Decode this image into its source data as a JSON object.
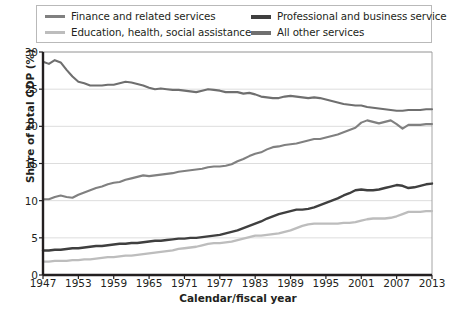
{
  "chart_data": {
    "type": "line",
    "title": "",
    "xlabel": "Calendar/fiscal year",
    "ylabel": "Share of total GDP (%)",
    "xlim": [
      1947,
      2013
    ],
    "ylim": [
      0,
      30
    ],
    "yticks": [
      0,
      5,
      10,
      15,
      20,
      25,
      30
    ],
    "xticks": [
      1947,
      1953,
      1959,
      1965,
      1971,
      1977,
      1983,
      1989,
      1995,
      2001,
      2007,
      2013
    ],
    "grid": "horizontal",
    "legend_position": "top",
    "x": [
      1947,
      1948,
      1949,
      1950,
      1951,
      1952,
      1953,
      1954,
      1955,
      1956,
      1957,
      1958,
      1959,
      1960,
      1961,
      1962,
      1963,
      1964,
      1965,
      1966,
      1967,
      1968,
      1969,
      1970,
      1971,
      1972,
      1973,
      1974,
      1975,
      1976,
      1977,
      1978,
      1979,
      1980,
      1981,
      1982,
      1983,
      1984,
      1985,
      1986,
      1987,
      1988,
      1989,
      1990,
      1991,
      1992,
      1993,
      1994,
      1995,
      1996,
      1997,
      1998,
      1999,
      2000,
      2001,
      2002,
      2003,
      2004,
      2005,
      2006,
      2007,
      2008,
      2009,
      2010,
      2011,
      2012,
      2013
    ],
    "series": [
      {
        "name": "All other services",
        "color": "#6f6f6f",
        "width": 2.1,
        "values": [
          28.7,
          28.4,
          28.9,
          28.6,
          27.6,
          26.7,
          26.0,
          25.8,
          25.5,
          25.5,
          25.5,
          25.6,
          25.6,
          25.8,
          26.0,
          25.9,
          25.7,
          25.5,
          25.2,
          25.0,
          25.1,
          25.0,
          24.9,
          24.9,
          24.8,
          24.7,
          24.6,
          24.8,
          25.0,
          24.9,
          24.8,
          24.6,
          24.6,
          24.6,
          24.4,
          24.5,
          24.3,
          24.0,
          23.9,
          23.8,
          23.8,
          24.0,
          24.1,
          24.0,
          23.9,
          23.8,
          23.9,
          23.8,
          23.6,
          23.4,
          23.2,
          23.0,
          22.9,
          22.8,
          22.8,
          22.6,
          22.5,
          22.4,
          22.3,
          22.2,
          22.1,
          22.1,
          22.2,
          22.2,
          22.2,
          22.3,
          22.3
        ]
      },
      {
        "name": "Finance and related services",
        "color": "#808080",
        "width": 2.1,
        "values": [
          10.2,
          10.2,
          10.5,
          10.7,
          10.5,
          10.4,
          10.8,
          11.1,
          11.4,
          11.7,
          11.9,
          12.2,
          12.4,
          12.5,
          12.8,
          13.0,
          13.2,
          13.4,
          13.3,
          13.4,
          13.5,
          13.6,
          13.7,
          13.9,
          14.0,
          14.1,
          14.2,
          14.3,
          14.5,
          14.6,
          14.6,
          14.7,
          14.9,
          15.3,
          15.6,
          16.0,
          16.3,
          16.5,
          16.9,
          17.2,
          17.3,
          17.5,
          17.6,
          17.7,
          17.9,
          18.1,
          18.3,
          18.3,
          18.5,
          18.7,
          18.9,
          19.2,
          19.5,
          19.8,
          20.5,
          20.8,
          20.6,
          20.4,
          20.6,
          20.8,
          20.3,
          19.7,
          20.2,
          20.2,
          20.2,
          20.3,
          20.3
        ]
      },
      {
        "name": "Professional and business service",
        "color": "#3f3f3f",
        "width": 2.4,
        "values": [
          3.3,
          3.3,
          3.4,
          3.4,
          3.5,
          3.6,
          3.6,
          3.7,
          3.8,
          3.9,
          3.9,
          4.0,
          4.1,
          4.2,
          4.2,
          4.3,
          4.3,
          4.4,
          4.5,
          4.6,
          4.6,
          4.7,
          4.8,
          4.9,
          4.9,
          5.0,
          5.0,
          5.1,
          5.2,
          5.3,
          5.4,
          5.6,
          5.8,
          6.0,
          6.3,
          6.6,
          6.9,
          7.2,
          7.6,
          7.9,
          8.2,
          8.4,
          8.6,
          8.8,
          8.8,
          8.9,
          9.1,
          9.4,
          9.7,
          10.0,
          10.3,
          10.7,
          11.0,
          11.4,
          11.5,
          11.4,
          11.4,
          11.5,
          11.7,
          11.9,
          12.1,
          12.0,
          11.7,
          11.8,
          12.0,
          12.2,
          12.3
        ]
      },
      {
        "name": "Education, health, social assistance",
        "color": "#bdbdbd",
        "width": 2.3,
        "values": [
          1.8,
          1.8,
          1.9,
          1.9,
          1.9,
          2.0,
          2.0,
          2.1,
          2.1,
          2.2,
          2.3,
          2.4,
          2.4,
          2.5,
          2.6,
          2.6,
          2.7,
          2.8,
          2.9,
          3.0,
          3.1,
          3.2,
          3.3,
          3.5,
          3.6,
          3.7,
          3.8,
          4.0,
          4.2,
          4.3,
          4.3,
          4.4,
          4.5,
          4.7,
          4.9,
          5.1,
          5.3,
          5.3,
          5.4,
          5.5,
          5.6,
          5.8,
          6.0,
          6.3,
          6.6,
          6.8,
          6.9,
          6.9,
          6.9,
          6.9,
          6.9,
          7.0,
          7.0,
          7.1,
          7.3,
          7.5,
          7.6,
          7.6,
          7.6,
          7.7,
          7.9,
          8.2,
          8.5,
          8.5,
          8.5,
          8.6,
          8.6
        ]
      }
    ]
  },
  "legend": {
    "items": [
      {
        "label": "Finance and related services",
        "color": "#808080",
        "row": 1,
        "col": 1
      },
      {
        "label": "Professional and business service",
        "color": "#3f3f3f",
        "row": 1,
        "col": 2
      },
      {
        "label": "Education, health, social assistance",
        "color": "#bdbdbd",
        "row": 2,
        "col": 1
      },
      {
        "label": "All other services",
        "color": "#6f6f6f",
        "row": 2,
        "col": 2
      }
    ]
  },
  "axes": {
    "y_axis_title": "Share of total GDP (%)",
    "x_axis_title": "Calendar/fiscal year",
    "y_tick_labels": [
      "30",
      "25",
      "20",
      "15",
      "10",
      "5",
      "0"
    ],
    "x_tick_labels": [
      "1947",
      "1953",
      "1959",
      "1965",
      "1971",
      "1977",
      "1983",
      "1989",
      "1995",
      "2001",
      "2007",
      "2013"
    ]
  },
  "colors": {
    "axis": "#231f20",
    "grid": "#d9d9d9",
    "frame": "#9a9a9a",
    "background": "#ffffff"
  }
}
